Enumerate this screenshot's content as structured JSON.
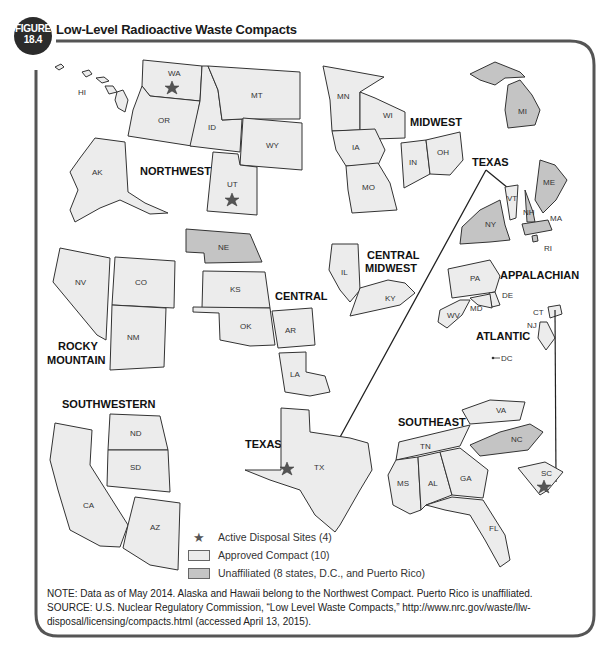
{
  "figure": {
    "label_line1": "FIGURE",
    "label_line2": "18.4",
    "title": "Low-Level Radioactive Waste Compacts"
  },
  "colors": {
    "approved": "#ececec",
    "unaffiliated": "#c4c4c4",
    "border": "#555555",
    "star": "#555555"
  },
  "regions": {
    "northwest": "NORTHWEST",
    "midwest": "MIDWEST",
    "texas_top": "TEXAS",
    "rocky_1": "ROCKY",
    "rocky_2": "MOUNTAIN",
    "central": "CENTRAL",
    "central_midwest_1": "CENTRAL",
    "central_midwest_2": "MIDWEST",
    "appalachian": "APPALACHIAN",
    "atlantic": "ATLANTIC",
    "southwestern": "SOUTHWESTERN",
    "texas": "TEXAS",
    "southeast": "SOUTHEAST"
  },
  "states": {
    "HI": "HI",
    "WA": "WA",
    "OR": "OR",
    "ID": "ID",
    "MT": "MT",
    "WY": "WY",
    "UT": "UT",
    "AK": "AK",
    "MN": "MN",
    "WI": "WI",
    "IA": "IA",
    "MO": "MO",
    "IN": "IN",
    "OH": "OH",
    "MI": "MI",
    "VT": "VT",
    "ME": "ME",
    "NH": "NH",
    "MA": "MA",
    "NY": "NY",
    "RI": "RI",
    "NV": "NV",
    "CO": "CO",
    "NM": "NM",
    "NE": "NE",
    "KS": "KS",
    "OK": "OK",
    "AR": "AR",
    "LA": "LA",
    "IL": "IL",
    "KY": "KY",
    "PA": "PA",
    "DE": "DE",
    "MD": "MD",
    "WV": "WV",
    "CT": "CT",
    "NJ": "NJ",
    "DC": "DC",
    "ND": "ND",
    "SD": "SD",
    "CA": "CA",
    "AZ": "AZ",
    "TX": "TX",
    "VA": "VA",
    "TN": "TN",
    "NC": "NC",
    "SC": "SC",
    "MS": "MS",
    "AL": "AL",
    "GA": "GA",
    "FL": "FL"
  },
  "legend": {
    "active": "Active Disposal Sites (4)",
    "approved": "Approved Compact (10)",
    "unaffiliated": "Unaffiliated (8 states, D.C., and Puerto Rico)"
  },
  "notes": {
    "note": "NOTE: Data as of May 2014. Alaska and Hawaii belong to the Northwest Compact. Puerto Rico is unaffiliated.",
    "source": "SOURCE: U.S. Nuclear Regulatory Commission, “Low Level Waste Compacts,” http://www.nrc.gov/waste/llw-disposal/licensing/compacts.html (accessed April 13, 2015)."
  }
}
